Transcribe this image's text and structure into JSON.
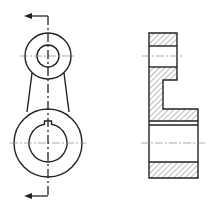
{
  "drawing": {
    "title": "Lever (connecting arm) — front view with section cutting plane and sectional side view",
    "colors": {
      "line": "#222222",
      "center": "#888888",
      "hatch": "#555555",
      "background": "#ffffff"
    },
    "front_view": {
      "upper_boss": {
        "cx": 48,
        "cy": 56,
        "outer_r": 23,
        "hole_r": 11
      },
      "lower_boss": {
        "cx": 48,
        "cy": 143,
        "outer_r": 34,
        "hole_r": 19,
        "keyway": true
      },
      "cutting_plane": {
        "arrow_top_y": 16,
        "arrow_bottom_y": 196,
        "arrow_tip_x": 25
      }
    },
    "section_view": {
      "upper_bore_center_y": 56,
      "lower_bore_center_y": 143,
      "hatched": true
    }
  }
}
